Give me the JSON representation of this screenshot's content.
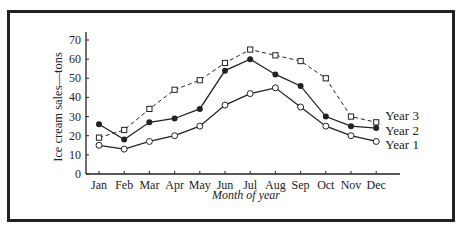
{
  "chart_data": {
    "type": "line",
    "title": "",
    "xlabel": "Month of year",
    "ylabel": "Ice cream sales—tons",
    "ylim": [
      0,
      70
    ],
    "yticks": [
      0,
      10,
      20,
      30,
      40,
      50,
      60,
      70
    ],
    "grid": false,
    "legend_position": "inline-right",
    "categories": [
      "Jan",
      "Feb",
      "Mar",
      "Apr",
      "May",
      "Jun",
      "Jul",
      "Aug",
      "Sep",
      "Oct",
      "Nov",
      "Dec"
    ],
    "series": [
      {
        "name": "Year 3",
        "marker": "square-open",
        "line": "dashed",
        "values": [
          19,
          23,
          34,
          44,
          49,
          58,
          65,
          62,
          59,
          50,
          30,
          27
        ]
      },
      {
        "name": "Year 2",
        "marker": "circle-filled",
        "line": "solid",
        "values": [
          26,
          18,
          27,
          29,
          34,
          54,
          60,
          52,
          46,
          30,
          25,
          24
        ]
      },
      {
        "name": "Year 1",
        "marker": "circle-open",
        "line": "solid",
        "values": [
          15,
          13,
          17,
          20,
          25,
          36,
          42,
          45,
          35,
          25,
          20,
          17
        ]
      }
    ]
  }
}
